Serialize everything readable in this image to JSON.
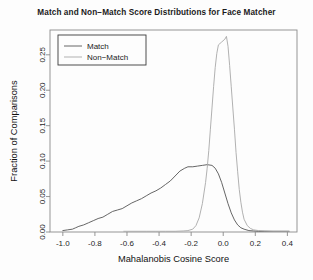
{
  "chart_data": {
    "type": "line",
    "title": "Match and Non−Match Score Distributions for Face Matcher",
    "xlabel": "Mahalanobis Cosine Score",
    "ylabel": "Fraction of Comparisons",
    "xlim": [
      -1.08,
      0.46
    ],
    "ylim": [
      0.0,
      0.285
    ],
    "xticks": [
      -1.0,
      -0.8,
      -0.6,
      -0.4,
      -0.2,
      0.0,
      0.2,
      0.4
    ],
    "xticklabels": [
      "-1.0",
      "-0.8",
      "-0.6",
      "-0.4",
      "-0.2",
      "0.0",
      "0.2",
      "0.4"
    ],
    "yticks": [
      0.0,
      0.05,
      0.1,
      0.15,
      0.2,
      0.25
    ],
    "yticklabels": [
      "0.00",
      "0.05",
      "0.10",
      "0.15",
      "0.20",
      "0.25"
    ],
    "grid": false,
    "legend_position": "top-left",
    "series": [
      {
        "name": "Match",
        "color": "#555555",
        "points": [
          [
            -1.0,
            0.002
          ],
          [
            -0.97,
            0.003
          ],
          [
            -0.94,
            0.004
          ],
          [
            -0.92,
            0.006
          ],
          [
            -0.9,
            0.008
          ],
          [
            -0.87,
            0.01
          ],
          [
            -0.84,
            0.013
          ],
          [
            -0.81,
            0.016
          ],
          [
            -0.78,
            0.019
          ],
          [
            -0.75,
            0.021
          ],
          [
            -0.72,
            0.025
          ],
          [
            -0.69,
            0.029
          ],
          [
            -0.66,
            0.031
          ],
          [
            -0.63,
            0.033
          ],
          [
            -0.6,
            0.037
          ],
          [
            -0.57,
            0.041
          ],
          [
            -0.54,
            0.044
          ],
          [
            -0.51,
            0.047
          ],
          [
            -0.48,
            0.051
          ],
          [
            -0.45,
            0.055
          ],
          [
            -0.42,
            0.058
          ],
          [
            -0.39,
            0.062
          ],
          [
            -0.36,
            0.067
          ],
          [
            -0.33,
            0.072
          ],
          [
            -0.3,
            0.079
          ],
          [
            -0.27,
            0.086
          ],
          [
            -0.24,
            0.09
          ],
          [
            -0.22,
            0.092
          ],
          [
            -0.19,
            0.092
          ],
          [
            -0.16,
            0.093
          ],
          [
            -0.13,
            0.094
          ],
          [
            -0.1,
            0.095
          ],
          [
            -0.07,
            0.094
          ],
          [
            -0.05,
            0.09
          ],
          [
            -0.03,
            0.082
          ],
          [
            -0.01,
            0.07
          ],
          [
            0.01,
            0.055
          ],
          [
            0.03,
            0.04
          ],
          [
            0.05,
            0.027
          ],
          [
            0.07,
            0.017
          ],
          [
            0.09,
            0.01
          ],
          [
            0.11,
            0.006
          ],
          [
            0.13,
            0.004
          ],
          [
            0.16,
            0.002
          ],
          [
            0.19,
            0.0015
          ],
          [
            0.22,
            0.001
          ],
          [
            0.26,
            0.001
          ],
          [
            0.31,
            0.001
          ],
          [
            0.36,
            0.001
          ],
          [
            0.41,
            0.001
          ]
        ]
      },
      {
        "name": "Non−Match",
        "color": "#a8a8a8",
        "points": [
          [
            -0.62,
            0.001
          ],
          [
            -0.55,
            0.001
          ],
          [
            -0.48,
            0.001
          ],
          [
            -0.42,
            0.001
          ],
          [
            -0.36,
            0.001
          ],
          [
            -0.3,
            0.001
          ],
          [
            -0.25,
            0.0015
          ],
          [
            -0.22,
            0.002
          ],
          [
            -0.19,
            0.004
          ],
          [
            -0.17,
            0.009
          ],
          [
            -0.15,
            0.02
          ],
          [
            -0.13,
            0.04
          ],
          [
            -0.11,
            0.07
          ],
          [
            -0.1,
            0.09
          ],
          [
            -0.09,
            0.115
          ],
          [
            -0.08,
            0.145
          ],
          [
            -0.07,
            0.175
          ],
          [
            -0.06,
            0.205
          ],
          [
            -0.05,
            0.232
          ],
          [
            -0.04,
            0.252
          ],
          [
            -0.03,
            0.264
          ],
          [
            -0.01,
            0.268
          ],
          [
            0.01,
            0.272
          ],
          [
            0.02,
            0.276
          ],
          [
            0.03,
            0.262
          ],
          [
            0.04,
            0.235
          ],
          [
            0.05,
            0.205
          ],
          [
            0.06,
            0.175
          ],
          [
            0.07,
            0.145
          ],
          [
            0.08,
            0.112
          ],
          [
            0.09,
            0.085
          ],
          [
            0.1,
            0.06
          ],
          [
            0.11,
            0.042
          ],
          [
            0.12,
            0.028
          ],
          [
            0.13,
            0.018
          ],
          [
            0.15,
            0.009
          ],
          [
            0.17,
            0.005
          ],
          [
            0.19,
            0.003
          ],
          [
            0.22,
            0.002
          ],
          [
            0.26,
            0.0015
          ],
          [
            0.31,
            0.001
          ],
          [
            0.36,
            0.001
          ],
          [
            0.41,
            0.001
          ]
        ]
      }
    ],
    "legend": [
      {
        "label": "Match",
        "color": "#555555"
      },
      {
        "label": "Non−Match",
        "color": "#a8a8a8"
      }
    ]
  }
}
